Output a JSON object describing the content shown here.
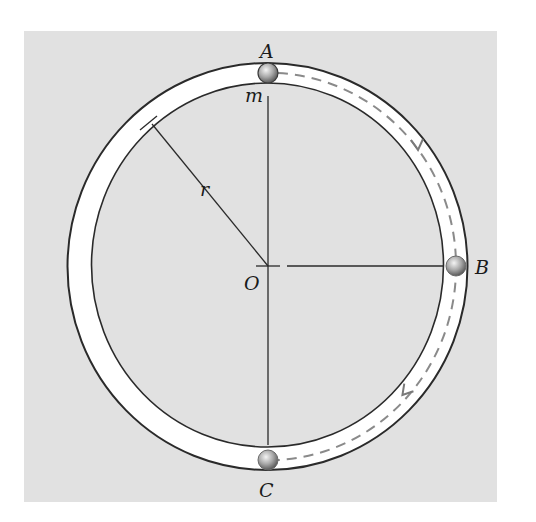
{
  "figure": {
    "labels": {
      "top_point": "A",
      "right_point": "B",
      "bottom_point": "C",
      "center": "O",
      "radius": "r",
      "mass": "m"
    },
    "colors": {
      "background_panel": "#e1e1e1",
      "tube_fill": "#ffffff",
      "tube_outline": "#2a2a2a",
      "path_dashes": "#8a8a8a",
      "ball": "#9a9a9a"
    }
  }
}
